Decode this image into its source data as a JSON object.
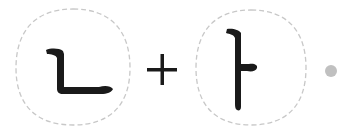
{
  "equation": {
    "left_jamo": {
      "char": "ㄴ",
      "label": "nieun"
    },
    "operator": "+",
    "right_jamo": {
      "char": "ㅏ",
      "label": "a"
    },
    "result_indicator": "dot"
  },
  "colors": {
    "stroke": "#1a1a1a",
    "dashed_border": "#c8c8c8",
    "dot": "#c0c0c0",
    "background": "#ffffff"
  }
}
